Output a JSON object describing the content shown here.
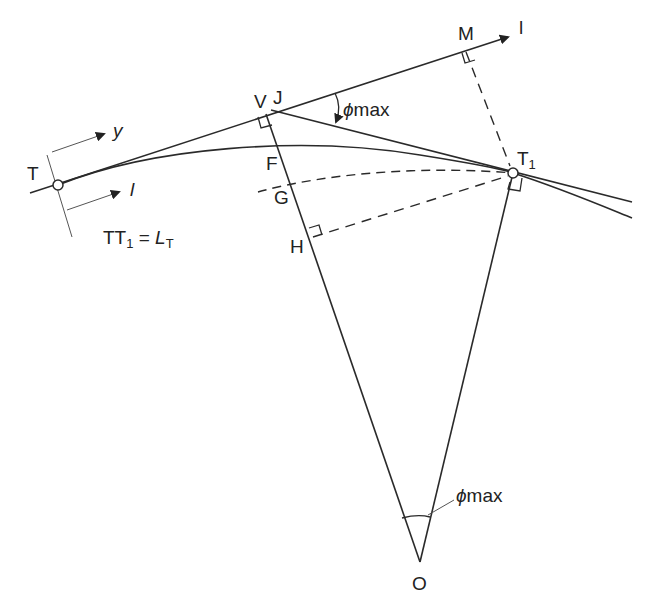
{
  "diagram": {
    "type": "geometry",
    "labels": {
      "T": "T",
      "T1_main": "T",
      "T1_sub": "1",
      "V": "V",
      "J": "J",
      "M": "M",
      "F": "F",
      "G": "G",
      "H": "H",
      "O": "O",
      "axis_l_top": "l",
      "axis_y": "y",
      "axis_l_bottom": "l",
      "phi_top": "ϕ",
      "phi_top_sub": "max",
      "phi_bottom": "ϕ",
      "phi_bottom_sub": "max"
    },
    "equation": {
      "lhs_main": "TT",
      "lhs_sub": "1",
      "eq": " = ",
      "rhs_main": "L",
      "rhs_sub": "T"
    },
    "colors": {
      "stroke": "#2a2a2a",
      "thin": "#555555",
      "background": "#ffffff"
    }
  }
}
